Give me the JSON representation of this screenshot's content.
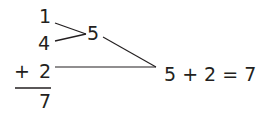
{
  "diagram": {
    "addends": [
      "1",
      "4",
      "2"
    ],
    "operator": "+",
    "sum": "7",
    "partial_sum": "5",
    "equation": "5 + 2 = 7"
  },
  "colors": {
    "ink": "#231f20",
    "background": "#ffffff"
  }
}
